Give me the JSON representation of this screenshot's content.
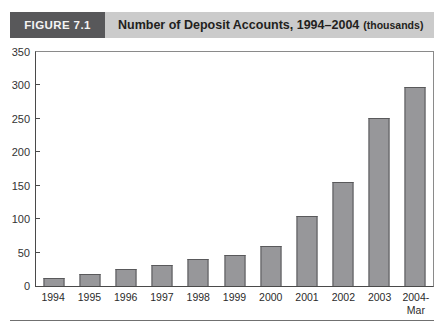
{
  "header": {
    "figure_label": "FIGURE 7.1",
    "title": "Number of Deposit Accounts, 1994–2004",
    "title_suffix": "(thousands)"
  },
  "chart_data": {
    "type": "bar",
    "title": "Number of Deposit Accounts, 1994–2004 (thousands)",
    "categories": [
      "1994",
      "1995",
      "1996",
      "1997",
      "1998",
      "1999",
      "2000",
      "2001",
      "2002",
      "2003",
      "2004-\nMar"
    ],
    "values": [
      12,
      18,
      26,
      32,
      41,
      47,
      60,
      104,
      155,
      252,
      297
    ],
    "xlabel": "",
    "ylabel": "",
    "ylim": [
      0,
      350
    ],
    "yticks": [
      0,
      50,
      100,
      150,
      200,
      250,
      300,
      350
    ],
    "grid": false,
    "legend": null,
    "bar_color": "#97979a",
    "bar_border_color": "#59595b"
  },
  "colors": {
    "header_box_bg": "#58585a",
    "header_strip_bg": "#cbcbcb",
    "axis_line": "#4a4a4a",
    "frame_line": "#8a8a8a",
    "rule_line": "#707070"
  }
}
